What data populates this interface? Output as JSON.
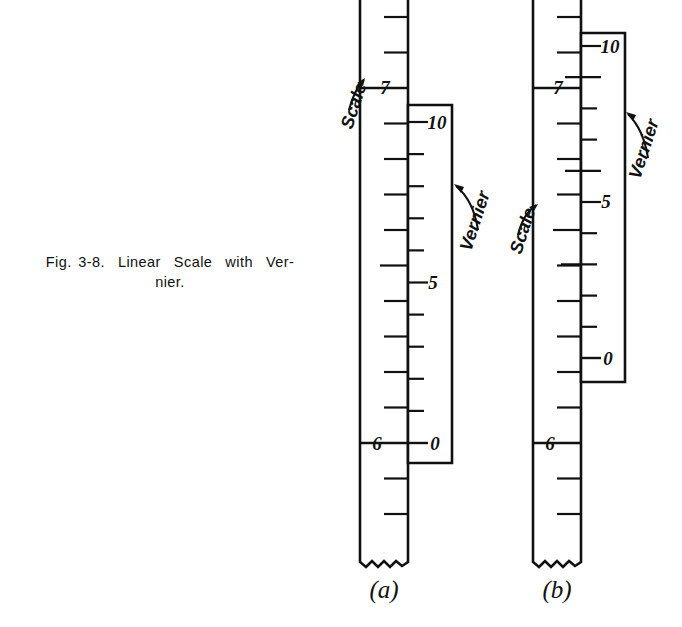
{
  "figure": {
    "caption_line_1": "Fig. 3-8.  Linear  Scale  with  Ver-",
    "caption_line_2": "nier.",
    "ink_color": "#111111",
    "background_color": "#ffffff"
  },
  "panels": [
    {
      "id": "a",
      "label": "(a)",
      "annotations": {
        "scale_label": "Scale",
        "vernier_label": "Vernier"
      },
      "scale": {
        "numbers": [
          "7",
          "6"
        ],
        "number_7": "7",
        "number_6": "6",
        "divisions_between_numbers": 10,
        "direction": "decreasing-downward"
      },
      "vernier": {
        "numbers": [
          "10",
          "5",
          "0"
        ],
        "number_top": "10",
        "number_mid": "5",
        "number_bottom": "0",
        "divisions": 10,
        "zero_aligns_with_scale": "6",
        "reading": "6.0"
      }
    },
    {
      "id": "b",
      "label": "(b)",
      "annotations": {
        "scale_label": "Scale",
        "vernier_label": "Vernier"
      },
      "scale": {
        "numbers": [
          "7",
          "6"
        ],
        "number_7": "7",
        "number_6": "6",
        "divisions_between_numbers": 10,
        "direction": "decreasing-downward"
      },
      "vernier": {
        "numbers": [
          "10",
          "5",
          "0"
        ],
        "number_top": "10",
        "number_mid": "5",
        "number_bottom": "0",
        "divisions": 10,
        "zero_aligns_with_scale": "between 6 and 7",
        "reading": "6.6"
      }
    }
  ]
}
